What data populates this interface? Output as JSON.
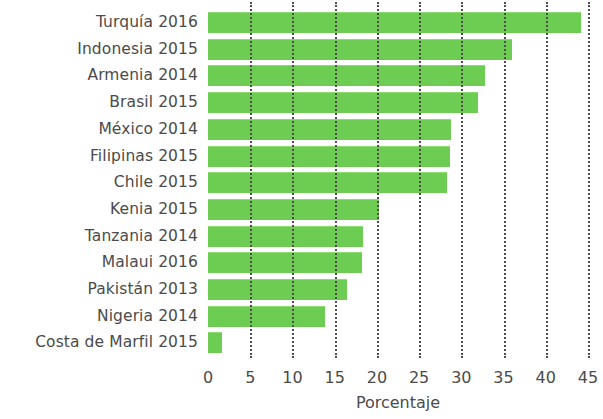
{
  "chart_data": {
    "type": "bar",
    "orientation": "horizontal",
    "title": "",
    "subtitle": "",
    "xlabel": "Porcentaje",
    "ylabel": "",
    "xlim": [
      0,
      45
    ],
    "xticks": [
      0,
      5,
      10,
      15,
      20,
      25,
      30,
      35,
      40,
      45
    ],
    "xtick_labels": [
      "0",
      "5",
      "10",
      "15",
      "20",
      "25",
      "30",
      "35",
      "40",
      "45"
    ],
    "grid": "vertical-dotted",
    "legend": "none",
    "bar_color": "#6dcd52",
    "text_color": "#4b4b4b",
    "grid_color": "#4d4d4d",
    "categories": [
      "Turquía 2016",
      "Indonesia 2015",
      "Armenia 2014",
      "Brasil 2015",
      "México 2014",
      "Filipinas 2015",
      "Chile 2015",
      "Kenia 2015",
      "Tanzania 2014",
      "Malaui 2016",
      "Pakistán 2013",
      "Nigeria 2014",
      "Costa de Marfil 2015"
    ],
    "values": [
      44.2,
      36.0,
      32.8,
      32.0,
      28.8,
      28.6,
      28.3,
      20.3,
      18.4,
      18.2,
      16.5,
      13.8,
      1.7
    ]
  }
}
